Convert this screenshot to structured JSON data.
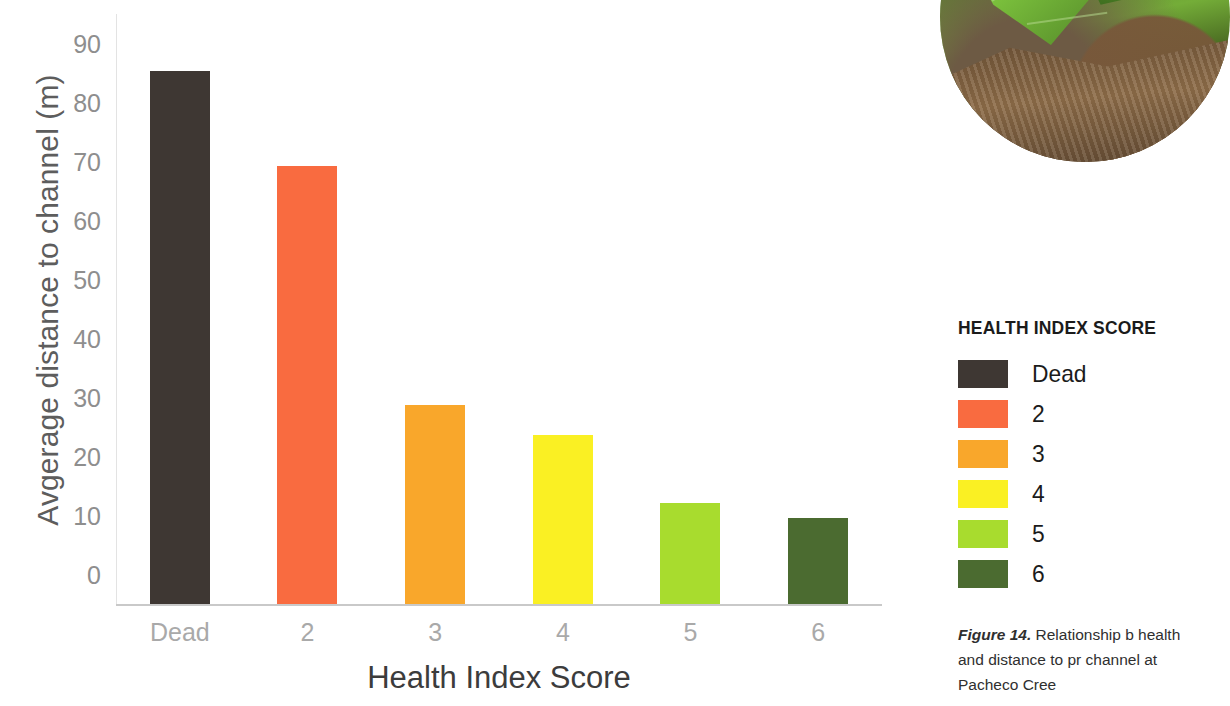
{
  "chart_data": {
    "type": "bar",
    "title": "",
    "xlabel": "Health Index Score",
    "ylabel": "Avgerage distance to channel (m)",
    "categories": [
      "Dead",
      "2",
      "3",
      "4",
      "5",
      "6"
    ],
    "values": [
      90.3,
      74.2,
      33.7,
      28.6,
      17.1,
      14.6
    ],
    "colors": [
      "#3E3733",
      "#F96B40",
      "#F9A72B",
      "#FAF023",
      "#A8DC2E",
      "#4B6B30"
    ],
    "ylim": [
      0,
      100
    ],
    "yticks": [
      "0",
      "10",
      "20",
      "30",
      "40",
      "50",
      "60",
      "70",
      "80",
      "90",
      "100"
    ],
    "ytick_values": [
      0,
      10,
      20,
      30,
      40,
      50,
      60,
      70,
      80,
      90,
      100
    ],
    "grid": false,
    "legend_position": "right"
  },
  "legend": {
    "title": "HEALTH INDEX SCORE",
    "items": [
      {
        "label": "Dead",
        "color": "#3E3733"
      },
      {
        "label": "2",
        "color": "#F96B40"
      },
      {
        "label": "3",
        "color": "#F9A72B"
      },
      {
        "label": "4",
        "color": "#FAF023"
      },
      {
        "label": "5",
        "color": "#A8DC2E"
      },
      {
        "label": "6",
        "color": "#4B6B30"
      }
    ]
  },
  "caption": {
    "figure_number": "Figure 14.",
    "text": " Relationship b health and distance to pr channel at Pacheco Cree"
  },
  "photo": {
    "alt": "circular-plant-photo"
  }
}
